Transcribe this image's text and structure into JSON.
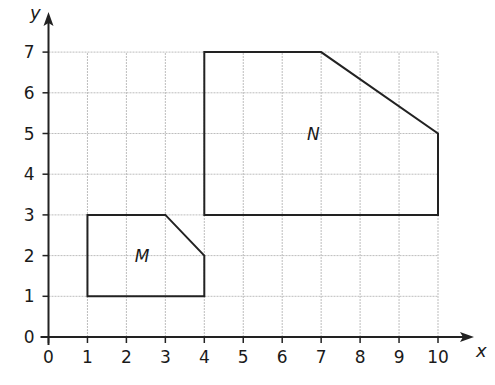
{
  "chart_data": {
    "type": "diagram",
    "title": "",
    "xlabel": "x",
    "ylabel": "y",
    "xlim": [
      0,
      10
    ],
    "ylim": [
      0,
      7
    ],
    "grid": true,
    "x_ticks": [
      "0",
      "1",
      "2",
      "3",
      "4",
      "5",
      "6",
      "7",
      "8",
      "9",
      "10"
    ],
    "y_ticks": [
      "0",
      "1",
      "2",
      "3",
      "4",
      "5",
      "6",
      "7"
    ],
    "shapes": [
      {
        "name": "M",
        "vertices": [
          [
            1,
            1
          ],
          [
            1,
            3
          ],
          [
            3,
            3
          ],
          [
            4,
            2
          ],
          [
            4,
            1
          ]
        ],
        "label_pos": [
          2.4,
          2
        ]
      },
      {
        "name": "N",
        "vertices": [
          [
            4,
            3
          ],
          [
            4,
            7
          ],
          [
            7,
            7
          ],
          [
            10,
            5
          ],
          [
            10,
            3
          ]
        ],
        "label_pos": [
          6.8,
          5
        ]
      }
    ]
  },
  "labels": {
    "x_axis": "x",
    "y_axis": "y",
    "shape_m": "M",
    "shape_n": "N"
  }
}
